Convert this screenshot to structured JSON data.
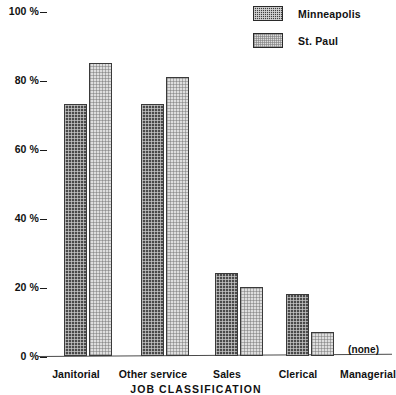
{
  "chart_data": {
    "type": "bar",
    "title": "",
    "xlabel": "JOB CLASSIFICATION",
    "ylabel": "",
    "ylim": [
      0,
      100
    ],
    "grid": false,
    "legend_position": "top-right",
    "categories": [
      "Janitorial",
      "Other service",
      "Sales",
      "Clerical",
      "Managerial"
    ],
    "ytick_labels": [
      "100 %",
      "80 %",
      "60 %",
      "40 %",
      "20 %",
      "0 %"
    ],
    "ytick_values": [
      100,
      80,
      60,
      40,
      20,
      0
    ],
    "series": [
      {
        "name": "Minneapolis",
        "values": [
          73,
          73,
          24,
          18,
          0
        ]
      },
      {
        "name": "St. Paul",
        "values": [
          85,
          81,
          20,
          7,
          0
        ]
      }
    ],
    "annotations": [
      {
        "text": "(none)",
        "category": "Managerial"
      }
    ]
  },
  "legend": {
    "items": [
      {
        "label": "Minneapolis",
        "swatch": "dark-crosshatch-swatch"
      },
      {
        "label": "St. Paul",
        "swatch": "light-crosshatch-swatch"
      }
    ]
  },
  "yaxis": {
    "ticks": [
      {
        "label": "100 %",
        "value": 100
      },
      {
        "label": "80 %",
        "value": 80
      },
      {
        "label": "60 %",
        "value": 60
      },
      {
        "label": "40 %",
        "value": 40
      },
      {
        "label": "20 %",
        "value": 20
      },
      {
        "label": "0 %",
        "value": 0
      }
    ]
  },
  "xaxis": {
    "title": "JOB CLASSIFICATION",
    "categories": [
      "Janitorial",
      "Other service",
      "Sales",
      "Clerical",
      "Managerial"
    ]
  },
  "notes": {
    "none_label": "(none)"
  }
}
